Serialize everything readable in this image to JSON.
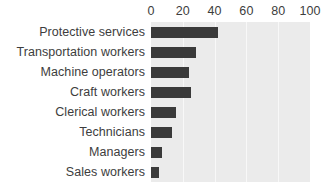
{
  "chart_data": {
    "type": "bar",
    "orientation": "horizontal",
    "title": "",
    "subtitle": "",
    "xlabel": "",
    "ylabel": "",
    "xlim": [
      0,
      100
    ],
    "xticks": [
      0,
      20,
      40,
      60,
      80,
      100
    ],
    "xtick_labels": [
      "0",
      "20",
      "40",
      "60",
      "80",
      "100"
    ],
    "grid": true,
    "grid_axis": "x",
    "legend": false,
    "legend_position": "none",
    "categories": [
      "Protective services",
      "Transportation workers",
      "Machine operators",
      "Craft workers",
      "Clerical workers",
      "Technicians",
      "Managers",
      "Sales workers"
    ],
    "values": [
      42,
      28,
      24,
      25,
      16,
      13,
      7,
      5
    ],
    "bars": [
      {
        "category": "Protective services",
        "value": 42
      },
      {
        "category": "Transportation workers",
        "value": 28
      },
      {
        "category": "Machine operators",
        "value": 24
      },
      {
        "category": "Craft workers",
        "value": 25
      },
      {
        "category": "Clerical workers",
        "value": 16
      },
      {
        "category": "Technicians",
        "value": 13
      },
      {
        "category": "Managers",
        "value": 7
      },
      {
        "category": "Sales workers",
        "value": 5
      }
    ]
  },
  "colors": {
    "bar": "#3a3a3a",
    "plot_background": "#ebebeb",
    "gridline": "#f8f8f8",
    "page_background": "#ffffff",
    "text": "#3d3d3d"
  }
}
